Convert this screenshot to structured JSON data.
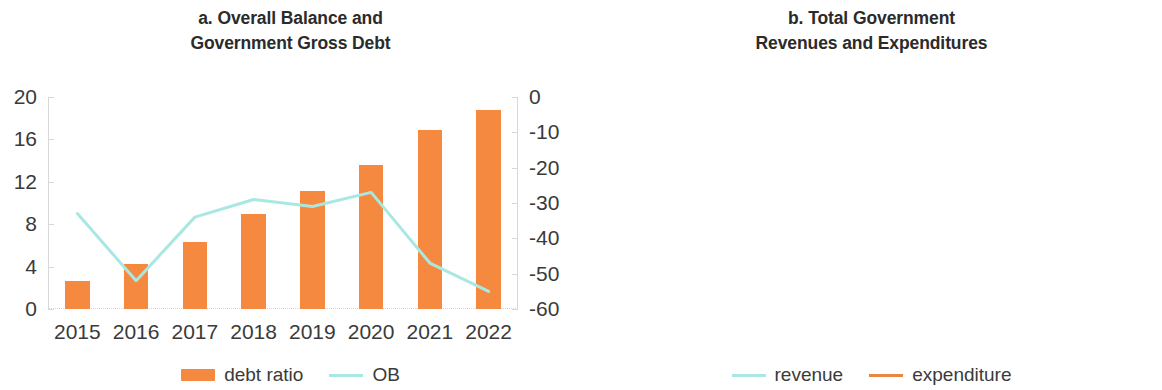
{
  "figure": {
    "colors": {
      "bar_orange": "#f5893f",
      "line_orange": "#e8873f",
      "line_cyan": "#a9e8e2",
      "axis_gray": "#d8d8d8",
      "text": "#3a3a3a"
    }
  },
  "panel_a": {
    "title_line1": "a. Overall Balance and",
    "title_line2": "Government Gross Debt",
    "legend": [
      {
        "label": "debt ratio",
        "marker": "bar-swatch",
        "color": "#f5893f"
      },
      {
        "label": "OB",
        "marker": "line-swatch",
        "color": "#a9e8e2"
      }
    ]
  },
  "panel_b": {
    "title_line1": "b. Total Government",
    "title_line2": "Revenues and Expenditures",
    "legend": [
      {
        "label": "revenue",
        "marker": "line-swatch",
        "color": "#a9e8e2"
      },
      {
        "label": "expenditure",
        "marker": "line-swatch",
        "color": "#e8873f"
      }
    ]
  },
  "chart_data": [
    {
      "id": "panel-a",
      "type": "bar",
      "title": "a. Overall Balance and Government Gross Debt",
      "xlabel": "",
      "ylabel": "",
      "grid": false,
      "legend_position": "bottom",
      "categories": [
        "2015",
        "2016",
        "2017",
        "2018",
        "2019",
        "2020",
        "2021",
        "2022"
      ],
      "x_tick_labels": [
        "2015",
        "2016",
        "2017",
        "2018",
        "2019",
        "2020",
        "2021",
        "2022"
      ],
      "y_left": {
        "ticks": [
          0,
          4,
          8,
          12,
          16,
          20
        ],
        "tick_labels": [
          "0",
          "4",
          "8",
          "12",
          "16",
          "20"
        ],
        "ylim": [
          0,
          20
        ]
      },
      "y_right": {
        "ticks": [
          0,
          -10,
          -20,
          -30,
          -40,
          -50,
          -60
        ],
        "tick_labels": [
          "0",
          "-10",
          "-20",
          "-30",
          "-40",
          "-50",
          "-60"
        ],
        "ylim": [
          -60,
          0
        ]
      },
      "series": [
        {
          "name": "debt ratio",
          "type": "bar",
          "axis": "left",
          "color": "#f5893f",
          "values": [
            2.6,
            4.2,
            6.3,
            9.0,
            11.1,
            13.6,
            16.9,
            18.8
          ]
        },
        {
          "name": "OB",
          "type": "line",
          "axis": "right",
          "color": "#a9e8e2",
          "values": [
            -33.0,
            -52.0,
            -34.0,
            -29.0,
            -31.0,
            -27.0,
            -47.0,
            -55.0
          ]
        }
      ]
    },
    {
      "id": "panel-b",
      "type": "line",
      "title": "b. Total Government Revenues and Expenditures",
      "xlabel": "",
      "ylabel": "",
      "grid": false,
      "legend_position": "bottom",
      "categories": [
        "2015",
        "2016",
        "2017",
        "2018",
        "2019",
        "2020",
        "2021",
        "2022"
      ],
      "x_tick_labels": [
        "2015",
        "2016",
        "2017",
        "2018",
        "2019",
        "2020",
        "2021",
        "2022"
      ],
      "y": {
        "ticks": [
          20,
          40,
          60,
          80,
          100,
          120
        ],
        "tick_labels": [
          "20",
          "40",
          "60",
          "80",
          "100",
          "120"
        ],
        "ylim": [
          20,
          120
        ]
      },
      "series": [
        {
          "name": "revenue",
          "type": "line",
          "color": "#a9e8e2",
          "values": [
            62.0,
            52.0,
            51.0,
            56.0,
            50.0,
            56.0,
            56.0,
            54.0
          ]
        },
        {
          "name": "expenditure",
          "type": "line",
          "color": "#e8873f",
          "values": [
            95.0,
            104.0,
            84.5,
            84.5,
            81.0,
            82.0,
            102.5,
            107.5
          ]
        }
      ]
    }
  ]
}
